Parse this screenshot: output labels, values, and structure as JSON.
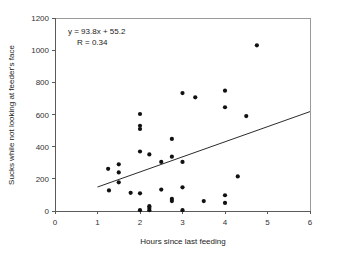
{
  "chart_data": {
    "type": "scatter",
    "title": "",
    "xlabel": "Hours since last feeding",
    "ylabel": "Sucks while not looking at feeder's face",
    "xlim": [
      0,
      6
    ],
    "ylim": [
      0,
      1200
    ],
    "xticks": [
      0,
      1,
      2,
      3,
      4,
      5,
      6
    ],
    "yticks": [
      0,
      200,
      400,
      600,
      800,
      1000,
      1200
    ],
    "xtick_labels": [
      "0",
      "1",
      "2",
      "3",
      "4",
      "5",
      "6"
    ],
    "ytick_labels": [
      "0",
      "200",
      "400",
      "600",
      "800",
      "1000",
      "1200"
    ],
    "grid": false,
    "legend": false,
    "annotations": [
      "y = 93.8x + 55.2",
      "R = 0.34"
    ],
    "equation": "y = 93.8x + 55.2",
    "correlation": "R = 0.34",
    "slope": 93.8,
    "intercept": 55.2,
    "r_value": 0.34,
    "trendline": {
      "x": [
        1.0,
        6.0
      ],
      "y": [
        149.0,
        618.0
      ]
    },
    "points": [
      {
        "x": 1.25,
        "y": 262
      },
      {
        "x": 1.27,
        "y": 128
      },
      {
        "x": 1.5,
        "y": 290
      },
      {
        "x": 1.5,
        "y": 240
      },
      {
        "x": 1.5,
        "y": 178
      },
      {
        "x": 1.78,
        "y": 113
      },
      {
        "x": 2.0,
        "y": 603
      },
      {
        "x": 2.0,
        "y": 530
      },
      {
        "x": 2.0,
        "y": 510
      },
      {
        "x": 2.0,
        "y": 370
      },
      {
        "x": 2.0,
        "y": 110
      },
      {
        "x": 2.0,
        "y": 5
      },
      {
        "x": 2.22,
        "y": 352
      },
      {
        "x": 2.22,
        "y": 30
      },
      {
        "x": 2.22,
        "y": 18
      },
      {
        "x": 2.22,
        "y": 5
      },
      {
        "x": 2.5,
        "y": 305
      },
      {
        "x": 2.5,
        "y": 133
      },
      {
        "x": 2.75,
        "y": 448
      },
      {
        "x": 2.75,
        "y": 338
      },
      {
        "x": 2.75,
        "y": 75
      },
      {
        "x": 2.75,
        "y": 62
      },
      {
        "x": 3.0,
        "y": 733
      },
      {
        "x": 3.0,
        "y": 305
      },
      {
        "x": 3.0,
        "y": 147
      },
      {
        "x": 3.0,
        "y": 5
      },
      {
        "x": 3.3,
        "y": 707
      },
      {
        "x": 3.5,
        "y": 62
      },
      {
        "x": 4.0,
        "y": 748
      },
      {
        "x": 4.0,
        "y": 645
      },
      {
        "x": 4.0,
        "y": 98
      },
      {
        "x": 4.0,
        "y": 50
      },
      {
        "x": 4.3,
        "y": 215
      },
      {
        "x": 4.5,
        "y": 590
      },
      {
        "x": 4.75,
        "y": 1030
      }
    ]
  }
}
